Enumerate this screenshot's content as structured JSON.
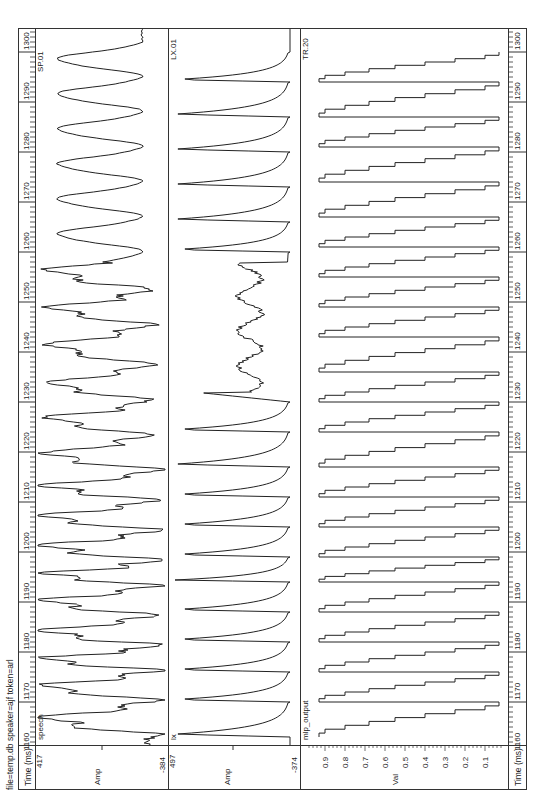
{
  "header": {
    "file_info": "file=temp.db speaker=ajf token=arl"
  },
  "time_axis": {
    "label": "Time (ms)",
    "ticks": [
      1160,
      1170,
      1180,
      1190,
      1200,
      1210,
      1220,
      1230,
      1240,
      1250,
      1260,
      1270,
      1280,
      1290,
      1300
    ],
    "start_ms": 1160,
    "end_ms": 1305
  },
  "panels": [
    {
      "id": "speech",
      "name": "speech",
      "tag": "SP.01",
      "ylabel": "Amp",
      "ymax_label": "417",
      "ymin_label": "-384"
    },
    {
      "id": "lx",
      "name": "lx",
      "tag": "LX.01",
      "ylabel": "Amp",
      "ymax_label": "497",
      "ymin_label": "-374"
    },
    {
      "id": "mlp",
      "name": "mlp_output",
      "tag": "TR.20",
      "ylabel": "Val",
      "ticks": [
        "0.9",
        "0.8",
        "0.7",
        "0.6",
        "0.5",
        "0.4",
        "0.3",
        "0.2",
        "0.1"
      ]
    }
  ],
  "chart_data": [
    {
      "type": "line",
      "title": "speech",
      "tag": "SP.01",
      "xlabel": "Time (ms)",
      "ylabel": "Amp",
      "xlim": [
        1160,
        1305
      ],
      "ylim": [
        -384,
        417
      ],
      "peaks_ms": [
        1163,
        1170,
        1176,
        1181,
        1187,
        1193,
        1198,
        1204,
        1210,
        1216,
        1223,
        1230,
        1237,
        1245,
        1252,
        1260,
        1267,
        1274,
        1281,
        1288,
        1295,
        1302
      ],
      "notes": "Quasi-periodic voiced speech waveform, irregular/noisy 1160-1215 ms, smoother sinusoid-like cycles 1255-1305 ms"
    },
    {
      "type": "line",
      "title": "lx",
      "tag": "LX.01",
      "xlabel": "Time (ms)",
      "ylabel": "Amp",
      "xlim": [
        1160,
        1305
      ],
      "ylim": [
        -374,
        497
      ],
      "closure_ms": [
        1163,
        1170,
        1176,
        1182,
        1188,
        1194,
        1199,
        1205,
        1211,
        1217,
        1224,
        1230,
        1260,
        1266,
        1273,
        1280,
        1287,
        1294,
        1300
      ],
      "notes": "Laryngograph signal: sharp glottal closure peaks followed by slow decay; weak/irregular region 1232-1258 ms"
    },
    {
      "type": "line",
      "title": "mlp_output",
      "tag": "TR.20",
      "xlabel": "Time (ms)",
      "ylabel": "Val",
      "xlim": [
        1160,
        1305
      ],
      "ylim": [
        0,
        1
      ],
      "yticks": [
        0.1,
        0.2,
        0.3,
        0.4,
        0.5,
        0.6,
        0.7,
        0.8,
        0.9
      ],
      "pulse_ms": [
        1163,
        1170,
        1176,
        1182,
        1188,
        1194,
        1199,
        1205,
        1211,
        1217,
        1224,
        1230,
        1236,
        1243,
        1249,
        1255,
        1261,
        1267,
        1274,
        1281,
        1287,
        1294,
        1300
      ],
      "notes": "Staircase MLP output rising to ~0.93 at each glottal closure, stepping down toward 0.05 before next pulse"
    }
  ]
}
